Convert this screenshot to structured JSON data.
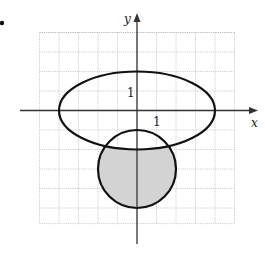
{
  "figure": {
    "bullet": true,
    "axes": {
      "x_label": "x",
      "y_label": "y",
      "x_tick_label": "1",
      "y_tick_label": "1"
    },
    "grid": {
      "x_range": [
        -5,
        5
      ],
      "y_range": [
        -5.8,
        4
      ],
      "step": 1
    },
    "curves": [
      {
        "type": "ellipse",
        "center": [
          0,
          0
        ],
        "rx": 4,
        "ry": 2,
        "filled": false
      },
      {
        "type": "circle",
        "center": [
          0,
          -3
        ],
        "r": 2,
        "filled": false
      }
    ],
    "shaded_region": {
      "description": "inside circle, outside ellipse",
      "color": "#d3d3d3"
    },
    "colors": {
      "curve": "#111111",
      "axis": "#333333",
      "grid": "#b8b8b8",
      "shade": "#d3d3d3"
    }
  }
}
